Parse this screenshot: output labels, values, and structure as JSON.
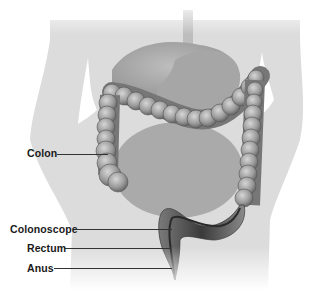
{
  "figure": {
    "labels": [
      {
        "id": "colon",
        "text": "Colon",
        "x": 27,
        "y": 147,
        "line_x1": 57,
        "line_x2": 108,
        "line_y": 154
      },
      {
        "id": "colonoscope",
        "text": "Colonoscope",
        "x": 10,
        "y": 223,
        "line_x1": 76,
        "line_x2": 172,
        "line_y": 229
      },
      {
        "id": "rectum",
        "text": "Rectum",
        "x": 27,
        "y": 242,
        "line_x1": 64,
        "line_x2": 170,
        "line_y": 248
      },
      {
        "id": "anus",
        "text": "Anus",
        "x": 27,
        "y": 262,
        "line_x1": 54,
        "line_x2": 172,
        "line_y": 268
      }
    ],
    "colors": {
      "silhouette": "#dcdcdc",
      "organ": "#a9a9a9",
      "colon_light": "#b8b8b8",
      "colon_dark": "#6a6a6a",
      "rectum_dark": "#3d3d3d",
      "label_text": "#1a1a1a"
    }
  }
}
